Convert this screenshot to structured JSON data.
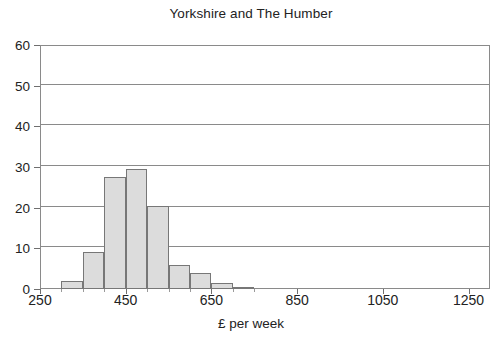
{
  "chart_data": {
    "type": "bar",
    "title": "Yorkshire and The Humber",
    "xlabel": "£ per week",
    "ylabel": "",
    "xlim": [
      250,
      1300
    ],
    "ylim": [
      0,
      60
    ],
    "grid": true,
    "legend": false,
    "bin_width": 50,
    "x_tick_labels": [
      "250",
      "450",
      "650",
      "850",
      "1050",
      "1250"
    ],
    "x_tick_values": [
      250,
      450,
      650,
      850,
      1050,
      1250
    ],
    "y_tick_labels": [
      "0",
      "10",
      "20",
      "30",
      "40",
      "50",
      "60"
    ],
    "y_tick_values": [
      0,
      10,
      20,
      30,
      40,
      50,
      60
    ],
    "bins": [
      {
        "start": 300,
        "end": 350,
        "value": 2
      },
      {
        "start": 350,
        "end": 400,
        "value": 9
      },
      {
        "start": 400,
        "end": 450,
        "value": 27.5
      },
      {
        "start": 450,
        "end": 500,
        "value": 29.5
      },
      {
        "start": 500,
        "end": 550,
        "value": 20.5
      },
      {
        "start": 550,
        "end": 600,
        "value": 6
      },
      {
        "start": 600,
        "end": 650,
        "value": 4
      },
      {
        "start": 650,
        "end": 700,
        "value": 1.5
      },
      {
        "start": 700,
        "end": 750,
        "value": 0.5
      }
    ],
    "categories": [
      "300-350",
      "350-400",
      "400-450",
      "450-500",
      "500-550",
      "550-600",
      "600-650",
      "650-700",
      "700-750"
    ],
    "values": [
      2,
      9,
      27.5,
      29.5,
      20.5,
      6,
      4,
      1.5,
      0.5
    ],
    "colors": {
      "bar_fill": "#dcdcdc",
      "bar_stroke": "#777777",
      "grid": "#8a8a8a",
      "text": "#222222",
      "background": "#ffffff"
    }
  }
}
